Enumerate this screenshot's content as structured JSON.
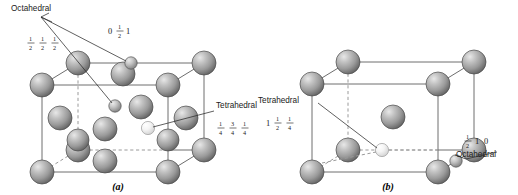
{
  "figure": {
    "panels": [
      {
        "id": "a",
        "caption": "(a)",
        "lattice": "FCC",
        "labels": {
          "octahedral": "Octahedral",
          "tetrahedral": "Tetrahedral"
        },
        "coordinates": {
          "octahedral_edge": {
            "parts": [
              "0",
              "1/2",
              "1"
            ],
            "display": "0 ½ 1"
          },
          "octahedral_center": {
            "parts": [
              "1/2",
              "1/2",
              "1/2"
            ],
            "display": "½ ½ ½"
          },
          "tetrahedral": {
            "parts": [
              "1/4",
              "3/4",
              "1/4"
            ],
            "display": "¼ ¾ ¼"
          }
        }
      },
      {
        "id": "b",
        "caption": "(b)",
        "lattice": "BCC",
        "labels": {
          "octahedral": "Octahedral",
          "tetrahedral": "Tetrahedral"
        },
        "coordinates": {
          "tetrahedral": {
            "parts": [
              "1",
              "1/2",
              "1/4"
            ],
            "display": "1 ½ ¼"
          },
          "octahedral": {
            "parts": [
              "1/2",
              "1",
              "0"
            ],
            "display": "½ 1 0"
          }
        }
      }
    ],
    "colors": {
      "host_atom_light": "#d8d8d8",
      "host_atom_mid": "#9e9e9e",
      "host_atom_dark": "#5f5f5f",
      "host_atom_outline": "#4a4a4a",
      "interstitial_octahedral": "#b9b9b9",
      "interstitial_tetrahedral": "#f1f1f1",
      "edge_visible": "#6e6e6e",
      "edge_hidden": "#9a9a9a",
      "leader_line": "#2b2b2b",
      "background": "#ffffff",
      "text": "#1a1a1a"
    }
  }
}
